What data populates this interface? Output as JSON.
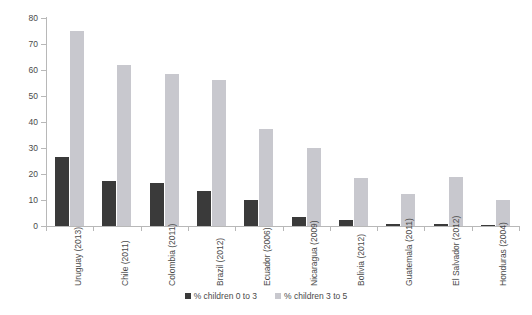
{
  "chart_data": {
    "type": "bar",
    "title": "",
    "xlabel": "",
    "ylabel": "",
    "ylim": [
      0,
      80
    ],
    "ytick_step": 10,
    "yticks": [
      0,
      10,
      20,
      30,
      40,
      50,
      60,
      70,
      80
    ],
    "grid": false,
    "legend_position": "bottom",
    "categories": [
      "Uruguay (2013)",
      "Chile (2011)",
      "Colombia (2011)",
      "Brazil (2012)",
      "Ecuador (2006)",
      "Nicaragua (2009)",
      "Bolivia (2012)",
      "Guatemala (2011)",
      "El Salvador (2012)",
      "Honduras (2004)"
    ],
    "series": [
      {
        "name": "% children 0 to 3",
        "color": "#3a3a3a",
        "values": [
          26.5,
          17.5,
          16.5,
          13.5,
          10.0,
          3.5,
          2.5,
          0.6,
          0.6,
          0.5
        ]
      },
      {
        "name": "% children 3 to 5",
        "color": "#c8c8ce",
        "values": [
          75.0,
          62.0,
          58.5,
          56.0,
          37.5,
          30.0,
          18.5,
          12.5,
          19.0,
          10.0
        ]
      }
    ]
  },
  "legend": {
    "items": [
      {
        "label": "% children 0 to 3",
        "color": "#3a3a3a"
      },
      {
        "label": "% children 3 to 5",
        "color": "#c8c8ce"
      }
    ]
  }
}
